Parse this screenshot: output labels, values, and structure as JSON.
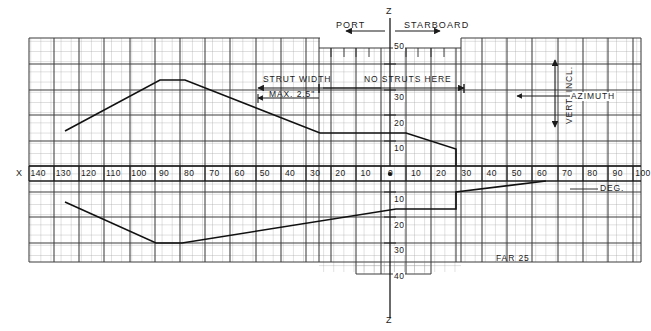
{
  "figure": {
    "standard_note": "FAR 25",
    "deg_unit": "DEG.",
    "x_axis_symbol": "X",
    "z_axis_symbol_top": "Z",
    "z_axis_symbol_bottom": "Z"
  },
  "annotations": {
    "port": "PORT",
    "starboard": "STARBOARD",
    "strut_width": "STRUT WIDTH",
    "strut_max": "MAX. 2.5\"",
    "no_struts": "NO STRUTS HERE",
    "vert_incl": "VERT. INCL.",
    "azimuth": "AZIMUTH"
  },
  "chart_data": {
    "type": "line",
    "xlabel": "DEG.",
    "ylabel": "DEG.",
    "xlim": [
      -140,
      100
    ],
    "ylim": [
      -40,
      50
    ],
    "grid": true,
    "legend": "none",
    "x_axis": {
      "name": "X",
      "port_side_label": "PORT",
      "starboard_side_label": "STARBOARD",
      "port_ticks": [
        140,
        130,
        120,
        110,
        100,
        90,
        80,
        70,
        60,
        50,
        40,
        30,
        20,
        10
      ],
      "origin_tick": 0,
      "starboard_ticks": [
        10,
        20,
        30,
        40,
        50,
        60,
        70,
        80,
        90,
        100
      ]
    },
    "z_axis": {
      "name": "Z",
      "up_ticks": [
        50,
        40,
        30,
        20,
        10
      ],
      "up_ticks_shown": [
        50,
        30,
        20,
        10
      ],
      "down_ticks": [
        10,
        20,
        30,
        40
      ]
    },
    "series": [
      {
        "name": "upper-envelope",
        "comment": "Upper boundary of coverage envelope, azimuth (deg) vs vertical inclination (deg up)",
        "points": [
          {
            "x": -135,
            "z": 11
          },
          {
            "x": -95,
            "z": 31
          },
          {
            "x": -85,
            "z": 31
          },
          {
            "x": -22,
            "z": 20
          },
          {
            "x": 10,
            "z": 20
          },
          {
            "x": 30,
            "z": 14
          },
          {
            "x": 30,
            "z": 0
          }
        ]
      },
      {
        "name": "lower-envelope",
        "comment": "Lower boundary of coverage envelope, azimuth (deg) vs vertical inclination (deg down)",
        "points": [
          {
            "x": -135,
            "z": -15
          },
          {
            "x": -92,
            "z": -30
          },
          {
            "x": -78,
            "z": -30
          },
          {
            "x": 5,
            "z": -14
          },
          {
            "x": 30,
            "z": -14
          },
          {
            "x": 30,
            "z": -10
          },
          {
            "x": 55,
            "z": -6
          }
        ]
      }
    ],
    "dimension_lines": [
      {
        "label": "STRUT WIDTH",
        "sublabel": "MAX. 2.5\"",
        "from_x": -60,
        "to_x": -18
      },
      {
        "label": "NO STRUTS HERE",
        "from_x": -18,
        "to_x": 32
      }
    ],
    "reference_arrows": [
      {
        "label": "VERT. INCL.",
        "orientation": "vertical"
      },
      {
        "label": "AZIMUTH",
        "orientation": "horizontal"
      }
    ]
  }
}
